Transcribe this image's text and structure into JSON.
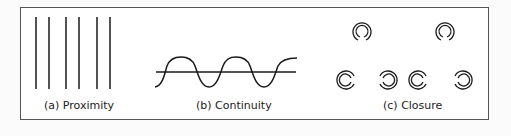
{
  "figure": {
    "panels": [
      {
        "id": "a",
        "caption": "(a) Proximity",
        "description": "six vertical lines grouped in three pairs"
      },
      {
        "id": "b",
        "caption": "(b) Continuity",
        "description": "sine wave crossing a horizontal line"
      },
      {
        "id": "c",
        "caption": "(c) Closure",
        "description": "six broken circles arranged in two rows"
      }
    ],
    "colors": {
      "stroke": "#1a1a1a",
      "frame": "#555555",
      "background": "#ffffff"
    }
  }
}
